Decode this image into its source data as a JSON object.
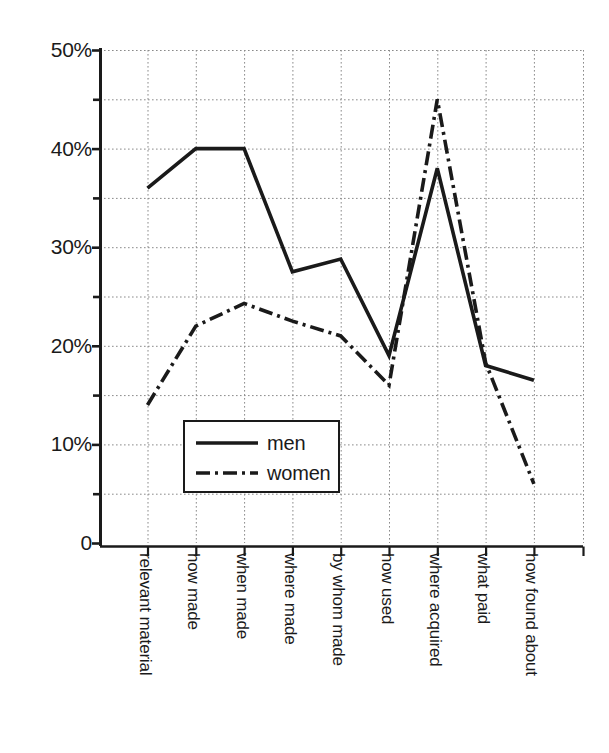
{
  "chart_data": {
    "type": "line",
    "title": "",
    "xlabel": "",
    "ylabel": "",
    "ylim": [
      0,
      50
    ],
    "grid": true,
    "legend_position": "inside-lower-left",
    "categories": [
      "relevant material",
      "how made",
      "when made",
      "where made",
      "by whom made",
      "how used",
      "where acquired",
      "what paid",
      "how found about"
    ],
    "y_tick_labels": [
      "50%",
      "40%",
      "30%",
      "20%",
      "10%",
      "0"
    ],
    "y_tick_values": [
      50,
      40,
      30,
      20,
      10,
      0
    ],
    "y_minor_tick_values": [
      45,
      35,
      25,
      15,
      5
    ],
    "series": [
      {
        "name": "men",
        "style": "solid",
        "color": "#1a1a1a",
        "values": [
          36.0,
          40.0,
          40.0,
          27.5,
          28.8,
          19.0,
          38.0,
          18.0,
          16.5
        ]
      },
      {
        "name": "women",
        "style": "dash-dot",
        "color": "#1a1a1a",
        "values": [
          14.0,
          22.0,
          24.3,
          22.5,
          21.0,
          16.0,
          45.0,
          18.3,
          6.0
        ]
      }
    ]
  },
  "legend": {
    "items": [
      {
        "label": "men",
        "style": "solid"
      },
      {
        "label": "women",
        "style": "dash-dot"
      }
    ]
  },
  "axes": {
    "y_labels": [
      "50%",
      "40%",
      "30%",
      "20%",
      "10%",
      "0"
    ],
    "x_labels": [
      "relevant material",
      "how made",
      "when made",
      "where made",
      "by whom made",
      "how used",
      "where acquired",
      "what paid",
      "how found about"
    ]
  }
}
